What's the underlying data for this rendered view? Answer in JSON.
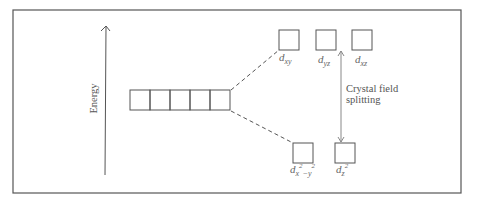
{
  "diagram": {
    "axis": {
      "label": "Energy",
      "direction": "up"
    },
    "degenerate_set": {
      "orbital_count": 5
    },
    "upper_set": {
      "orbitals": [
        {
          "name": "d",
          "sub": "xy"
        },
        {
          "name": "d",
          "sub": "yz"
        },
        {
          "name": "d",
          "sub": "xz"
        }
      ]
    },
    "lower_set": {
      "orbitals": [
        {
          "name": "d",
          "sub": "x",
          "sup1": "2",
          "mid": "−y",
          "sup2": "2"
        },
        {
          "name": "d",
          "sub": "z",
          "sup1": "2"
        }
      ]
    },
    "splitting_label": {
      "line1": "Crystal field",
      "line2": "splitting"
    },
    "colors": {
      "line": "#555555",
      "frame": "#444444",
      "arrow": "#888888"
    }
  }
}
